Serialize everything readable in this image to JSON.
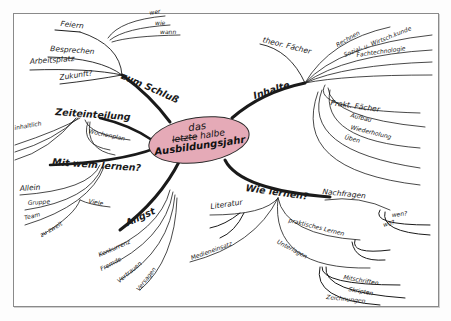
{
  "mindmap": {
    "center": {
      "line1": "das",
      "line2_struck": "letzte",
      "line2": "halbe",
      "line3": "Ausbildungsjahr",
      "fill": "#e5aab7"
    },
    "branches": {
      "zum_schluss": {
        "label": "zum Schluß",
        "children": {
          "feiern": "Feiern",
          "wer": "wer",
          "wie": "wie",
          "wann": "wann",
          "besprechen": "Besprechen",
          "arbeitsplatz": "Arbeitsplatz",
          "zukunft": "Zukunft?"
        }
      },
      "inhalte": {
        "label": "Inhalte",
        "children": {
          "theor_faecher": "theor. Fächer",
          "rechnen": "Rechnen",
          "sozial": "Sozial- u. Wirtsch.kunde",
          "fachtechnologie": "Fachtechnologie",
          "prakt_faecher": "Prakt. Fächer",
          "aufbau": "Aufbau",
          "wiederholung": "Wiederholung",
          "ueben": "Üben"
        }
      },
      "zeiteinteilung": {
        "label": "Zeiteinteilung",
        "children": {
          "inhaltlich": "inhaltlich",
          "wochenplan": "Wochenplan"
        }
      },
      "mit_wem": {
        "label": "Mit wem lernen?",
        "children": {
          "allein": "Allein",
          "gruppe": "Gruppe",
          "viele": "Viele",
          "team": "Team",
          "zu_zweit": "zu zweit"
        }
      },
      "angst": {
        "label": "Angst",
        "children": {
          "konkurrenz": "Konkurrenz",
          "fremde": "Fremde",
          "vertrauen": "Vertrauen",
          "versagen": "Versagen"
        }
      },
      "wie_lernen": {
        "label": "Wie lernen?",
        "children": {
          "nachfragen": "Nachfragen",
          "wen": "wen?",
          "wo": "wo?",
          "literatur": "Literatur",
          "medieneinsatz": "Medieneinsatz",
          "praktisches_lernen": "praktisches Lernen",
          "unterlagen": "Unterlagen",
          "mitschriften": "Mitschriften",
          "skripten": "Skripten",
          "zeichnungen": "Zeichnungen"
        }
      }
    }
  }
}
